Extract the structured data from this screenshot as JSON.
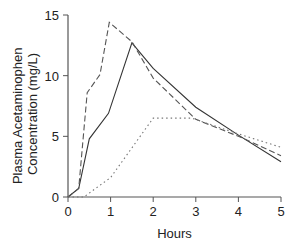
{
  "chart_data": {
    "type": "line",
    "title": "",
    "xlabel": "Hours",
    "ylabel": "Plasma Acetaminophen Concentration (mg/L)",
    "ylabel_lines": [
      "Plasma Acetaminophen",
      "Concentration (mg/L)"
    ],
    "xlim": [
      0,
      5
    ],
    "ylim": [
      0,
      15
    ],
    "xticks": [
      0,
      1,
      2,
      3,
      4,
      5
    ],
    "yticks": [
      0,
      5,
      10,
      15
    ],
    "xtick_labels": [
      "0",
      "1",
      "2",
      "3",
      "4",
      "5"
    ],
    "ytick_labels": [
      "0",
      "5",
      "10",
      "15"
    ],
    "grid": false,
    "legend": "none",
    "series": [
      {
        "name": "solid",
        "style": "solid",
        "color": "#333333",
        "x": [
          0,
          0.25,
          0.5,
          0.95,
          1.5,
          2.0,
          3.0,
          4.0,
          5.0
        ],
        "y": [
          0,
          0.7,
          4.8,
          6.9,
          12.7,
          10.6,
          7.4,
          5.1,
          2.9
        ]
      },
      {
        "name": "dashed",
        "style": "dashed",
        "color": "#555555",
        "x": [
          0,
          0.25,
          0.45,
          0.75,
          0.97,
          1.5,
          2.0,
          3.0,
          4.0,
          5.0
        ],
        "y": [
          0,
          0.7,
          8.6,
          10.1,
          14.4,
          12.8,
          9.8,
          6.4,
          5.0,
          3.4
        ]
      },
      {
        "name": "dotted",
        "style": "dotted",
        "color": "#777777",
        "x": [
          0,
          0.37,
          1.0,
          2.0,
          2.9,
          4.0,
          5.0
        ],
        "y": [
          0,
          0,
          1.6,
          6.5,
          6.5,
          5.2,
          4.1
        ]
      }
    ]
  }
}
